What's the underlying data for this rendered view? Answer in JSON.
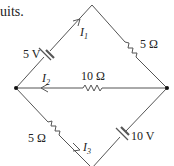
{
  "caption": "uits.",
  "diagram": {
    "type": "circuit",
    "nodes": [
      {
        "id": "top",
        "x": 92,
        "y": 5
      },
      {
        "id": "left",
        "x": 16,
        "y": 88
      },
      {
        "id": "right",
        "x": 167,
        "y": 88
      },
      {
        "id": "bottom",
        "x": 92,
        "y": 168
      }
    ],
    "labels": {
      "battery_top_left": "5 V",
      "resistor_top_right": "5 Ω",
      "resistor_middle": "10 Ω",
      "resistor_bottom_left": "5 Ω",
      "battery_bottom_right": "10 V",
      "current_1": "I",
      "current_1_sub": "1",
      "current_2": "I",
      "current_2_sub": "2",
      "current_3": "I",
      "current_3_sub": "3"
    },
    "colors": {
      "wire": "#555555",
      "node": "#111111",
      "text": "#222222"
    }
  }
}
